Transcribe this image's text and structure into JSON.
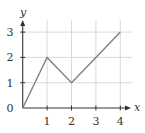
{
  "chart_data": {
    "type": "line",
    "title": "",
    "xlabel": "x",
    "ylabel": "y",
    "x": [
      0,
      1,
      2,
      3,
      4
    ],
    "series": [
      {
        "name": "f(x)",
        "values": [
          0,
          2,
          1,
          2,
          3
        ]
      }
    ],
    "xlim": [
      0,
      4
    ],
    "ylim": [
      0,
      3
    ],
    "xticks": [
      "1",
      "2",
      "3",
      "4"
    ],
    "yticks": [
      "0",
      "1",
      "2",
      "3"
    ],
    "grid": true,
    "legend": "none"
  },
  "colors": {
    "axis": "#333333",
    "grid": "#d0d0d0",
    "line": "#808080"
  }
}
